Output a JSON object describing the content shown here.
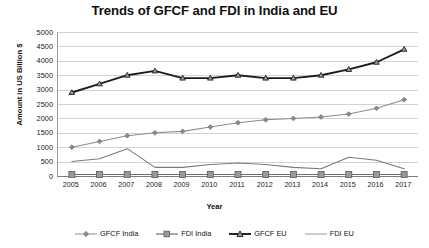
{
  "chart_data": {
    "type": "line",
    "title": "Trends of GFCF and FDI in India and EU",
    "xlabel": "Year",
    "ylabel": "Amount in US Billion $",
    "grid": true,
    "legend_position": "bottom",
    "ylim": [
      0,
      5000
    ],
    "ytick_step": 500,
    "yticks": [
      "5000",
      "4500",
      "4000",
      "3500",
      "3000",
      "2500",
      "2000",
      "1500",
      "1000",
      "500",
      "0"
    ],
    "categories": [
      "2005",
      "2006",
      "2007",
      "2008",
      "2009",
      "2010",
      "2011",
      "2012",
      "2013",
      "2014",
      "2015",
      "2016",
      "2017"
    ],
    "series": [
      {
        "name": "GFCF India",
        "marker": "diamond",
        "color": "#8c8c8c",
        "values": [
          1000,
          1200,
          1400,
          1500,
          1550,
          1700,
          1850,
          1950,
          2000,
          2050,
          2150,
          2350,
          2650
        ]
      },
      {
        "name": "FDI India",
        "marker": "square",
        "color": "#6e6e6e",
        "values": [
          50,
          50,
          50,
          50,
          50,
          50,
          50,
          50,
          50,
          50,
          50,
          50,
          50
        ]
      },
      {
        "name": "GFCF EU",
        "marker": "triangle",
        "color": "#1c1c1c",
        "values": [
          2900,
          3200,
          3500,
          3650,
          3400,
          3400,
          3500,
          3400,
          3400,
          3500,
          3700,
          3950,
          4400
        ]
      },
      {
        "name": "FDI EU",
        "marker": "none",
        "color": "#7a7a7a",
        "values": [
          500,
          600,
          950,
          300,
          300,
          400,
          450,
          400,
          300,
          250,
          650,
          550,
          250
        ]
      }
    ]
  },
  "legend": {
    "items": [
      {
        "label": "GFCF India",
        "marker": "diamond-marker-icon"
      },
      {
        "label": "FDI India",
        "marker": "square-marker-icon"
      },
      {
        "label": "GFCF EU",
        "marker": "triangle-marker-icon"
      },
      {
        "label": "FDI EU",
        "marker": "line-marker-icon"
      }
    ]
  }
}
